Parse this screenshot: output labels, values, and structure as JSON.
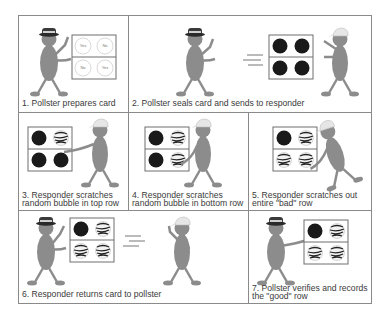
{
  "diagram": {
    "colors": {
      "border": "#8a8a8a",
      "figure_body": "#8c8c8c",
      "bubble_filled": "#1a1a1a",
      "text": "#3a3a3a"
    },
    "panels": [
      {
        "step": 1,
        "caption": "1. Pollster prepares card",
        "card": [
          "Yes",
          "No",
          "No",
          "Yes"
        ],
        "card_state": "open"
      },
      {
        "step": 2,
        "caption": "2. Pollster seals card and sends to responder",
        "card_state": "all-sealed"
      },
      {
        "step": 3,
        "caption": "3. Responder scratches\nrandom bubble in top row",
        "card_state": "top-right-scratched"
      },
      {
        "step": 4,
        "caption": "4. Responder scratches\nrandom bubble in bottom row",
        "card_state": "top-right-and-bottom-right-scratched"
      },
      {
        "step": 5,
        "caption": "5. Responder scratches out\nentire \"bad\" row",
        "card_state": "bottom-row-scratched"
      },
      {
        "step": 6,
        "caption": "6. Responder returns card to pollster",
        "card_state": "bottom-row-scratched"
      },
      {
        "step": 7,
        "caption": "7. Pollster verifies and records\nthe \"good\" row",
        "card_state": "bottom-row-scratched"
      }
    ]
  }
}
